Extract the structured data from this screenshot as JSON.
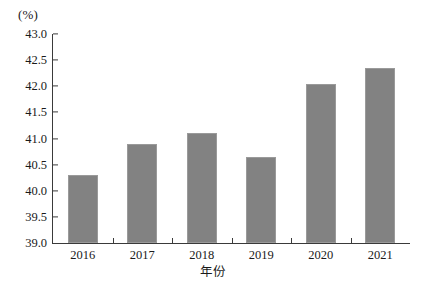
{
  "chart_data": {
    "type": "bar",
    "title": "",
    "subtitle": "",
    "xlabel": "年份",
    "ylabel": "",
    "yunit": "(%)",
    "categories": [
      "2016",
      "2017",
      "2018",
      "2019",
      "2020",
      "2021"
    ],
    "values": [
      40.3,
      40.9,
      41.1,
      40.65,
      42.05,
      42.35
    ],
    "ylim": [
      39.0,
      43.0
    ],
    "ytick_step": 0.5,
    "ytick_labels": [
      "43.0",
      "42.5",
      "42.0",
      "41.5",
      "41.0",
      "40.5",
      "40.0",
      "39.5",
      "39.0"
    ],
    "ytick_values": [
      43.0,
      42.5,
      42.0,
      41.5,
      41.0,
      40.5,
      40.0,
      39.5,
      39.0
    ],
    "grid": false,
    "legend": null,
    "legend_position": "none",
    "series": [
      {
        "name": "",
        "values": [
          40.3,
          40.9,
          41.1,
          40.65,
          42.05,
          42.35
        ]
      }
    ],
    "annotations": [],
    "colors": {
      "bar_fill": "#828282",
      "bar_edge": "#9a9a9a",
      "axis": "#3a3a3a",
      "text": "#1a1a1a",
      "background": "#ffffff"
    }
  }
}
